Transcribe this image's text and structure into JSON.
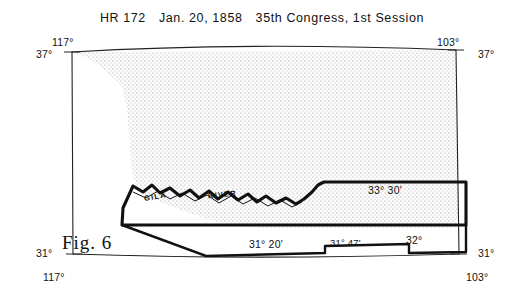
{
  "header": {
    "bill": "HR 172",
    "date": "Jan. 20, 1858",
    "congress": "35th Congress, 1st Session"
  },
  "figure": {
    "caption": "Fig. 6"
  },
  "map": {
    "river_label": "GILA",
    "river_label2": "RIVER",
    "corner_labels": {
      "top_left_lon": "117°",
      "top_left_lat": "37°",
      "top_right_lon": "103°",
      "top_right_lat": "37°",
      "bottom_left_lat": "31°",
      "bottom_left_lon": "117°",
      "bottom_right_lat": "31°",
      "bottom_right_lon": "103°"
    },
    "boundary_labels": [
      {
        "text": "33° 30'",
        "x": 368,
        "y": 190
      },
      {
        "text": "31° 20'",
        "x": 249,
        "y": 243
      },
      {
        "text": "31° 47'",
        "x": 330,
        "y": 242
      },
      {
        "text": "32°",
        "x": 406,
        "y": 238
      }
    ],
    "colors": {
      "outline": "#111111",
      "stipple": "#8a8a8a",
      "frame": "#222222"
    }
  }
}
